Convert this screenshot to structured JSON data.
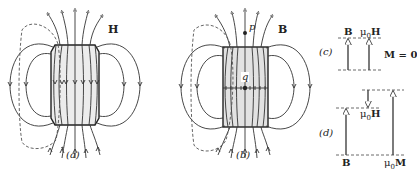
{
  "figure": {
    "panels": [
      {
        "id": "a",
        "caption": "(a)",
        "field_label": "H",
        "description": "H field of a bar magnet; lines run opposite direction inside the magnet"
      },
      {
        "id": "b",
        "caption": "(b)",
        "field_label": "B",
        "point_outside": "p",
        "point_inside": "q",
        "description": "B field of a bar magnet; continuous closed loops"
      },
      {
        "id": "c",
        "caption": "(c)",
        "vectors": [
          "B",
          "μ0H"
        ],
        "condition": "M = 0"
      },
      {
        "id": "d",
        "caption": "(d)",
        "vectors": [
          "B",
          "μ0H",
          "μ0M"
        ]
      }
    ]
  },
  "labels": {
    "a_caption": "(a)",
    "a_field": "H",
    "b_caption": "(b)",
    "b_field": "B",
    "b_p": "p",
    "b_q": "q",
    "c_caption": "(c)",
    "c_B": "B",
    "c_mu0": "μ",
    "c_sub0": "0",
    "c_H": "H",
    "c_condition": "M = 0",
    "d_caption": "(d)",
    "d_B": "B",
    "d_mu0H_mu": "μ",
    "d_mu0H_sub": "0",
    "d_mu0H_H": "H",
    "d_mu0M_mu": "μ",
    "d_mu0M_sub": "0",
    "d_mu0M_M": "M"
  },
  "colors": {
    "line": "#333333",
    "magnet_fill": "#e6e6e6",
    "dashed": "#555555"
  }
}
